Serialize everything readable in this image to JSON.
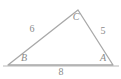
{
  "diagram": {
    "type": "triangle",
    "stroke_color": "#a8a8a8",
    "label_color": "#8a8a8a",
    "background_color": "#ffffff",
    "vertices": [
      {
        "name": "B",
        "label": "B",
        "x": 8,
        "y": 65,
        "label_x": 24,
        "label_y": 58
      },
      {
        "name": "A",
        "label": "A",
        "x": 113,
        "y": 65,
        "label_x": 103,
        "label_y": 58
      },
      {
        "name": "C",
        "label": "C",
        "x": 78,
        "y": 10,
        "label_x": 76,
        "label_y": 17
      }
    ],
    "sides": [
      {
        "name": "side-bc",
        "label": "6",
        "from": "B",
        "to": "C",
        "label_x": 32,
        "label_y": 29
      },
      {
        "name": "side-ca",
        "label": "5",
        "from": "C",
        "to": "A",
        "label_x": 103,
        "label_y": 31
      },
      {
        "name": "side-ba",
        "label": "8",
        "from": "B",
        "to": "A",
        "label_x": 61,
        "label_y": 72
      }
    ],
    "baseline": {
      "x1": 3,
      "y1": 66,
      "x2": 119,
      "y2": 66
    }
  }
}
